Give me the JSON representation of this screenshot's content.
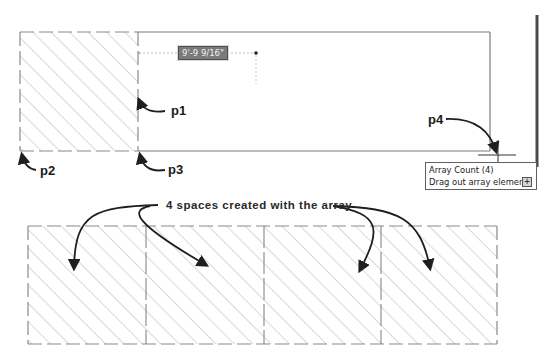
{
  "drawing": {
    "top_space": {
      "dimension_value": "9'-9 9/16\"",
      "points": [
        {
          "id": "p1",
          "label": "p1"
        },
        {
          "id": "p2",
          "label": "p2"
        },
        {
          "id": "p3",
          "label": "p3"
        },
        {
          "id": "p4",
          "label": "p4"
        }
      ]
    },
    "tooltip": {
      "title": "Array Count (4)",
      "prompt": "Drag out array elements or",
      "expand_glyph": "+"
    },
    "array_result": {
      "callout": "4 spaces created with the array",
      "space_count": 4
    }
  },
  "colors": {
    "background": "#ffffff",
    "outline": "#7a7a7a",
    "hatch": "#b8b8b8",
    "arrow": "#1f1f1f",
    "viewport_edge": "#4a4a4a"
  }
}
